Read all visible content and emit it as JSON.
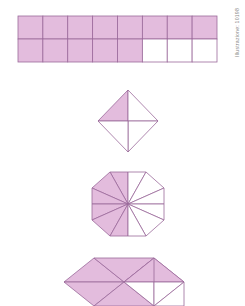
{
  "document": {
    "title": "Fraction shading diagram worksheet",
    "background_color": "#ffffff"
  },
  "style": {
    "fill_color": "#e3bcdd",
    "empty_color": "#ffffff",
    "stroke_color": "#9b6a9b",
    "stroke_width": 0.8
  },
  "watermark": {
    "text": "Illustrazione: 10198",
    "color": "#8a8a8a",
    "orientation": "vertical",
    "position": "top-right"
  },
  "figures": [
    {
      "id": "figure-1",
      "name": "shaded-rectangle-grid",
      "shape": "rectangle-grid",
      "columns": 8,
      "rows": 2,
      "bounds": {
        "x": 18,
        "y": 16,
        "width": 199,
        "height": 46
      },
      "total_parts": 16,
      "shaded_parts": 13,
      "fraction": "13/16",
      "cells_shaded": [
        [
          true,
          true,
          true,
          true,
          true,
          true,
          true,
          true
        ],
        [
          true,
          true,
          true,
          true,
          true,
          false,
          false,
          false
        ]
      ]
    },
    {
      "id": "figure-2",
      "name": "shaded-diamond-quarters",
      "shape": "square-rotated",
      "bounds": {
        "x": 98,
        "y": 90,
        "width": 60,
        "height": 62
      },
      "total_parts": 4,
      "shaded_parts": 1,
      "fraction": "1/4",
      "wedges_shaded": [
        true,
        false,
        false,
        false
      ]
    },
    {
      "id": "figure-3",
      "name": "shaded-hexagon-twelfths",
      "shape": "hexagon",
      "bounds": {
        "x": 92,
        "y": 172,
        "width": 72,
        "height": 64
      },
      "total_parts": 12,
      "shaded_parts": 6,
      "fraction": "6/12",
      "wedges_shaded": [
        false,
        false,
        false,
        true,
        true,
        true,
        true,
        true,
        true,
        false,
        false,
        false
      ]
    },
    {
      "id": "figure-4",
      "name": "shaded-double-rhombus",
      "shape": "rhombus-pair",
      "bounds": {
        "x": 64,
        "y": 258,
        "width": 120,
        "height": 48
      },
      "total_parts": 8,
      "shaded_parts": 5,
      "fraction": "5/8",
      "triangles_shaded": [
        true,
        true,
        true,
        true,
        true,
        false,
        false,
        false
      ]
    }
  ]
}
